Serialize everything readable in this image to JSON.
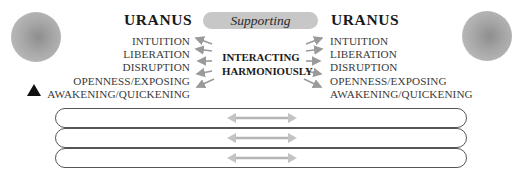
{
  "header": {
    "left_title": "URANUS",
    "right_title": "URANUS",
    "relationship": "Supporting"
  },
  "center_label": {
    "line1": "INTERACTING",
    "line2": "HARMONIOUSLY"
  },
  "left_keywords": [
    "INTUITION",
    "LIBERATION",
    "DISRUPTION",
    "OPENNESS/EXPOSING",
    "AWAKENING/QUICKENING"
  ],
  "right_keywords": [
    "INTUITION",
    "LIBERATION",
    "DISRUPTION",
    "OPENNESS/EXPOSING",
    "AWAKENING/QUICKENING"
  ],
  "icons": {
    "left_planet": "planet-sphere-icon",
    "right_planet": "planet-sphere-icon",
    "marker": "triangle-up-icon",
    "bar_arrow": "double-headed-arrow-icon"
  },
  "bars": [
    {
      "text": ""
    },
    {
      "text": ""
    },
    {
      "text": ""
    }
  ],
  "colors": {
    "planet": "#a6a6a6",
    "pill": "#c7c7c7",
    "arrow": "#9a9a9a",
    "bar_border": "#555555"
  }
}
